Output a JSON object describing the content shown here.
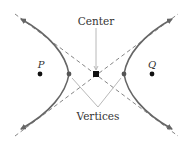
{
  "diagram": {
    "type": "hyperbola",
    "labels": {
      "center": "Center",
      "vertices": "Vertices",
      "focus_left": "P",
      "focus_right": "Q"
    },
    "colors": {
      "curve": "#666666",
      "asymptote": "#777777",
      "pointer": "#b0b0b0",
      "point": "#111111",
      "vertex_point": "#555555",
      "text": "#333333"
    }
  }
}
